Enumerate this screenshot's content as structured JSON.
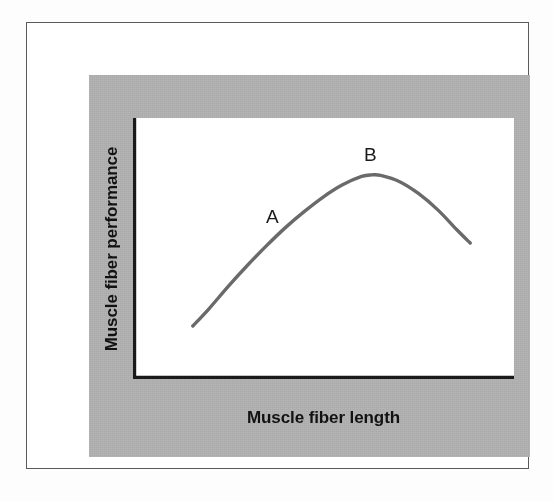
{
  "figure": {
    "background_color": "#ffffff",
    "frame_border_color": "#5a5a5a",
    "panel_color": "#b5b5b5",
    "plot_background_color": "#ffffff",
    "axis_color": "#1a1a1a",
    "curve_color": "#6a6a6a"
  },
  "chart_data": {
    "type": "line",
    "title": "",
    "subtitle": "",
    "xlabel": "Muscle fiber length",
    "ylabel": "Muscle fiber performance",
    "grid": false,
    "legend": null,
    "legend_position": "none",
    "axis_ticks": {
      "x": [],
      "y": []
    },
    "xlim": [
      0,
      100
    ],
    "ylim": [
      0,
      100
    ],
    "series": [
      {
        "name": "length-tension relationship",
        "color": "#6a6a6a",
        "x": [
          15.7,
          20.0,
          25.0,
          30.0,
          35.0,
          40.0,
          45.0,
          50.0,
          55.0,
          60.0,
          62.7,
          65.0,
          70.0,
          75.0,
          80.0,
          85.0,
          88.5
        ],
        "y": [
          20.3,
          27.0,
          35.5,
          43.5,
          51.0,
          58.0,
          64.2,
          69.8,
          74.4,
          77.6,
          78.2,
          78.0,
          75.6,
          71.0,
          64.8,
          57.2,
          52.1
        ]
      }
    ],
    "annotations": [
      {
        "label": "A",
        "x": 37.0,
        "y": 62.0,
        "description": "ascending limb of the curve"
      },
      {
        "label": "B",
        "x": 62.7,
        "y": 86.0,
        "description": "peak of the curve (optimal length)"
      }
    ]
  }
}
